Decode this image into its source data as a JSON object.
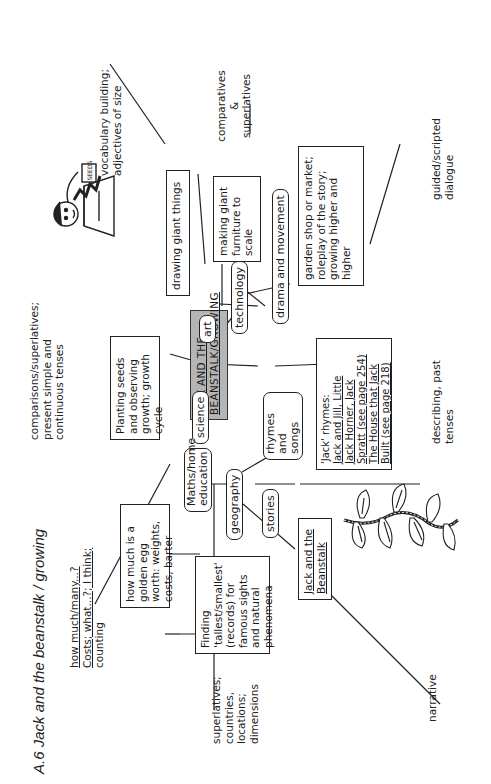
{
  "title": "A.6 Jack and the beanstalk / growing",
  "center": {
    "line1": "JACK AND THE",
    "line2": "BEANSTALK/GROWING"
  },
  "subjects": [
    {
      "id": "science",
      "label": "science"
    },
    {
      "id": "maths",
      "label": "Maths/home education"
    },
    {
      "id": "geography",
      "label": "geography"
    },
    {
      "id": "stories",
      "label": "stories"
    },
    {
      "id": "rhymes",
      "label": "rhymes and songs"
    },
    {
      "id": "drama",
      "label": "drama and movement"
    },
    {
      "id": "technology",
      "label": "technology"
    },
    {
      "id": "art",
      "label": "art"
    }
  ],
  "activities": {
    "science": "Planting seeds and observing growth; growth cycle",
    "maths": "how much is a golden egg worth: weights, costs, barter",
    "geography": "Finding 'tallest/smallest' (records) for famous sights and natural phenomena",
    "stories": "Jack and the Beanstalk",
    "rhymes": {
      "line1": "'Jack' rhymes:",
      "line2": "Jack and Jill, Little",
      "line3": "Jack Horner, Jack",
      "line4": "Spratt (see page 254)",
      "line5": "The House that Jack",
      "line6": "Built (see page 218)"
    },
    "drama": "garden shop or market; roleplay of the story; growing higher and higher",
    "technology": "making giant furniture to scale",
    "art": "drawing giant things"
  },
  "language_focus": {
    "science": "comparisons/superlatives; present simple and continuous tenses",
    "maths": {
      "line1": "how much/many...?",
      "line2": "Costs; what...?; I think;",
      "line3": "counting"
    },
    "geography": "superlatives; countries, locations; dimensions",
    "stories": "narrative",
    "rhymes": "describing, past tenses",
    "drama": "guided/scripted dialogue",
    "technology": {
      "line1": "comparatives",
      "line2": "&",
      "line3": "superlatives"
    },
    "art": "vocabulary building; adjectives of size"
  },
  "illustrations": [
    {
      "name": "boy-with-seed-pot",
      "label": "SEEDS"
    },
    {
      "name": "beanstalk-vine"
    }
  ]
}
